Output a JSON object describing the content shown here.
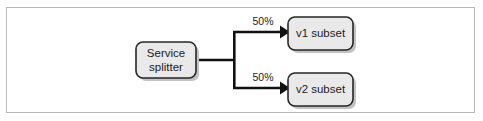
{
  "figure": {
    "type": "flow-diagram",
    "frame": {
      "border_color": "#b9b9b9",
      "background_color": "#ffffff"
    },
    "style": {
      "node_fill": "#e9e9e9",
      "node_stroke": "#262626",
      "node_shadow": "#c3c3c3",
      "connector_color": "#111111",
      "text_color": "#1b1b1b"
    },
    "nodes": [
      {
        "id": "service-splitter",
        "label_line_1": "Service",
        "label_line_2": "splitter"
      },
      {
        "id": "v1-subset",
        "label": "v1 subset"
      },
      {
        "id": "v2-subset",
        "label": "v2 subset"
      }
    ],
    "edges": [
      {
        "id": "edge-to-v1",
        "from": "service-splitter",
        "to": "v1-subset",
        "label": "50%"
      },
      {
        "id": "edge-to-v2",
        "from": "service-splitter",
        "to": "v2-subset",
        "label": "50%"
      }
    ]
  }
}
